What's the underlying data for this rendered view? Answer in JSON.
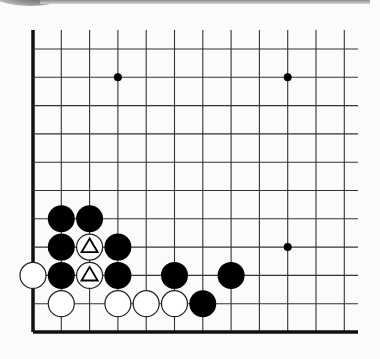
{
  "diagram": {
    "type": "go-board-corner",
    "view": "lower-left corner",
    "grid": {
      "columns": 12,
      "rows": 11,
      "x0": 33,
      "y_bottom": 332,
      "spacing": 28.3,
      "top_extent": 30,
      "right_extent": 358,
      "line_color": "#333333",
      "edge_color": "#111111"
    },
    "star_points": [
      {
        "col": 3,
        "row": 9
      },
      {
        "col": 9,
        "row": 9
      },
      {
        "col": 9,
        "row": 3
      }
    ],
    "stones": [
      {
        "color": "black",
        "col": 1,
        "row": 4
      },
      {
        "color": "black",
        "col": 2,
        "row": 4
      },
      {
        "color": "black",
        "col": 1,
        "row": 3
      },
      {
        "color": "white",
        "col": 2,
        "row": 3,
        "mark": "triangle"
      },
      {
        "color": "black",
        "col": 3,
        "row": 3
      },
      {
        "color": "white",
        "col": 0,
        "row": 2
      },
      {
        "color": "black",
        "col": 1,
        "row": 2
      },
      {
        "color": "white",
        "col": 2,
        "row": 2,
        "mark": "triangle"
      },
      {
        "color": "black",
        "col": 3,
        "row": 2
      },
      {
        "color": "black",
        "col": 5,
        "row": 2
      },
      {
        "color": "black",
        "col": 7,
        "row": 2
      },
      {
        "color": "white",
        "col": 1,
        "row": 1
      },
      {
        "color": "white",
        "col": 3,
        "row": 1
      },
      {
        "color": "white",
        "col": 4,
        "row": 1
      },
      {
        "color": "white",
        "col": 5,
        "row": 1
      },
      {
        "color": "black",
        "col": 6,
        "row": 1
      }
    ],
    "colors": {
      "black_stone": "#000000",
      "white_stone": "#ffffff",
      "white_outline": "#222222",
      "background": "#fbfbfb"
    }
  }
}
